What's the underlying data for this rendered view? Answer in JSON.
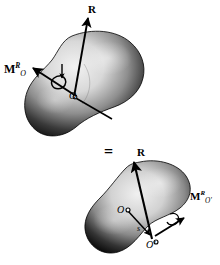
{
  "figure": {
    "background_color": "#ffffff",
    "ink_color": "#000000",
    "body_fill_light": "#e8e8e8",
    "body_fill_mid": "#9a9a9a",
    "body_fill_dark": "#1a1a1a"
  },
  "upper": {
    "force_label": "R",
    "moment_label_base": "M",
    "moment_label_sup": "R",
    "moment_label_sub": "O",
    "origin_label": "O",
    "icons": {
      "force_arrow": "force-vector-arrow",
      "moment_arrow": "double-headed-moment-arrow",
      "rotation_curl": "curved-rotation-arrow",
      "origin_dot": "origin-point-marker"
    }
  },
  "equals": {
    "symbol": "="
  },
  "lower": {
    "force_label": "R",
    "moment_label_base": "M",
    "moment_label_sup": "R",
    "moment_label_sub": "O′",
    "origin_label": "O",
    "origin_prime_label": "O′",
    "position_vector_label": "s",
    "icons": {
      "force_arrow": "force-vector-arrow",
      "moment_arrow": "double-headed-moment-arrow",
      "position_arrow": "position-vector-arrow",
      "origin_dot": "origin-point-marker",
      "origin_prime_dot": "origin-prime-point-marker"
    }
  }
}
